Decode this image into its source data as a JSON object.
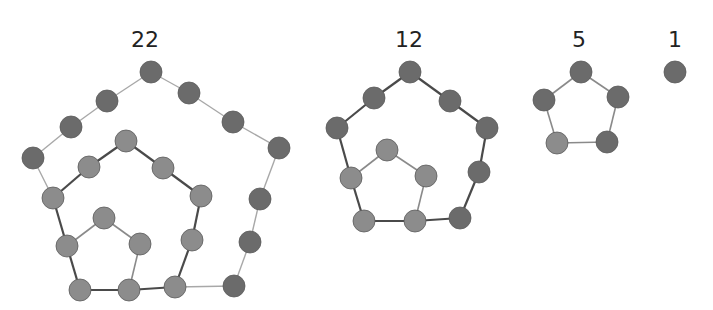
{
  "colors": {
    "node_dark": "#6b6b6b",
    "node_light": "#8c8c8c",
    "node_stroke": "#5a5a5a",
    "edge_thin": "#a8a8a8",
    "edge_thick": "#4a4a4a",
    "edge_mid": "#8a8a8a",
    "label": "#222222"
  },
  "node_radius": 11,
  "graphs": [
    {
      "label": "22",
      "label_pos": [
        145,
        47
      ],
      "nodes": [
        {
          "id": 0,
          "x": 151,
          "y": 72,
          "tone": "dark"
        },
        {
          "id": 1,
          "x": 107,
          "y": 101,
          "tone": "dark"
        },
        {
          "id": 2,
          "x": 71,
          "y": 127,
          "tone": "dark"
        },
        {
          "id": 3,
          "x": 33,
          "y": 158,
          "tone": "dark"
        },
        {
          "id": 4,
          "x": 189,
          "y": 93,
          "tone": "dark"
        },
        {
          "id": 5,
          "x": 233,
          "y": 122,
          "tone": "dark"
        },
        {
          "id": 6,
          "x": 279,
          "y": 148,
          "tone": "dark"
        },
        {
          "id": 7,
          "x": 260,
          "y": 199,
          "tone": "dark"
        },
        {
          "id": 8,
          "x": 250,
          "y": 242,
          "tone": "dark"
        },
        {
          "id": 9,
          "x": 234,
          "y": 286,
          "tone": "dark"
        },
        {
          "id": 10,
          "x": 53,
          "y": 198,
          "tone": "light"
        },
        {
          "id": 11,
          "x": 89,
          "y": 167,
          "tone": "light"
        },
        {
          "id": 12,
          "x": 126,
          "y": 141,
          "tone": "light"
        },
        {
          "id": 13,
          "x": 163,
          "y": 168,
          "tone": "light"
        },
        {
          "id": 14,
          "x": 201,
          "y": 196,
          "tone": "light"
        },
        {
          "id": 15,
          "x": 192,
          "y": 240,
          "tone": "light"
        },
        {
          "id": 16,
          "x": 175,
          "y": 287,
          "tone": "light"
        },
        {
          "id": 17,
          "x": 129,
          "y": 290,
          "tone": "light"
        },
        {
          "id": 18,
          "x": 80,
          "y": 290,
          "tone": "light"
        },
        {
          "id": 19,
          "x": 67,
          "y": 246,
          "tone": "light"
        },
        {
          "id": 20,
          "x": 104,
          "y": 218,
          "tone": "light"
        },
        {
          "id": 21,
          "x": 140,
          "y": 244,
          "tone": "light"
        }
      ],
      "edges": [
        [
          0,
          1,
          "thin"
        ],
        [
          1,
          2,
          "thin"
        ],
        [
          2,
          3,
          "thin"
        ],
        [
          3,
          10,
          "thin"
        ],
        [
          0,
          4,
          "thin"
        ],
        [
          4,
          5,
          "thin"
        ],
        [
          5,
          6,
          "thin"
        ],
        [
          6,
          7,
          "thin"
        ],
        [
          7,
          8,
          "thin"
        ],
        [
          8,
          9,
          "thin"
        ],
        [
          9,
          16,
          "thin"
        ],
        [
          10,
          11,
          "thick"
        ],
        [
          11,
          12,
          "thick"
        ],
        [
          12,
          13,
          "thick"
        ],
        [
          13,
          14,
          "thick"
        ],
        [
          14,
          15,
          "thick"
        ],
        [
          15,
          16,
          "thick"
        ],
        [
          16,
          17,
          "thick"
        ],
        [
          17,
          18,
          "thick"
        ],
        [
          18,
          19,
          "thick"
        ],
        [
          19,
          10,
          "thick"
        ],
        [
          19,
          20,
          "mid"
        ],
        [
          20,
          21,
          "mid"
        ],
        [
          21,
          17,
          "mid"
        ]
      ]
    },
    {
      "label": "12",
      "label_pos": [
        409,
        47
      ],
      "nodes": [
        {
          "id": 0,
          "x": 410,
          "y": 72,
          "tone": "dark"
        },
        {
          "id": 1,
          "x": 374,
          "y": 98,
          "tone": "dark"
        },
        {
          "id": 2,
          "x": 337,
          "y": 128,
          "tone": "dark"
        },
        {
          "id": 3,
          "x": 450,
          "y": 101,
          "tone": "dark"
        },
        {
          "id": 4,
          "x": 487,
          "y": 128,
          "tone": "dark"
        },
        {
          "id": 5,
          "x": 479,
          "y": 172,
          "tone": "dark"
        },
        {
          "id": 6,
          "x": 460,
          "y": 218,
          "tone": "dark"
        },
        {
          "id": 7,
          "x": 415,
          "y": 221,
          "tone": "light"
        },
        {
          "id": 8,
          "x": 364,
          "y": 221,
          "tone": "light"
        },
        {
          "id": 9,
          "x": 351,
          "y": 178,
          "tone": "light"
        },
        {
          "id": 10,
          "x": 387,
          "y": 150,
          "tone": "light"
        },
        {
          "id": 11,
          "x": 426,
          "y": 176,
          "tone": "light"
        }
      ],
      "edges": [
        [
          0,
          1,
          "thick"
        ],
        [
          1,
          2,
          "thick"
        ],
        [
          0,
          3,
          "thick"
        ],
        [
          3,
          4,
          "thick"
        ],
        [
          4,
          5,
          "thick"
        ],
        [
          5,
          6,
          "thick"
        ],
        [
          6,
          7,
          "thick"
        ],
        [
          7,
          8,
          "thick"
        ],
        [
          8,
          9,
          "thick"
        ],
        [
          9,
          2,
          "thick"
        ],
        [
          9,
          10,
          "mid"
        ],
        [
          10,
          11,
          "mid"
        ],
        [
          11,
          7,
          "mid"
        ]
      ]
    },
    {
      "label": "5",
      "label_pos": [
        579,
        47
      ],
      "nodes": [
        {
          "id": 0,
          "x": 581,
          "y": 72,
          "tone": "dark"
        },
        {
          "id": 1,
          "x": 544,
          "y": 100,
          "tone": "dark"
        },
        {
          "id": 2,
          "x": 618,
          "y": 97,
          "tone": "dark"
        },
        {
          "id": 3,
          "x": 557,
          "y": 143,
          "tone": "light"
        },
        {
          "id": 4,
          "x": 607,
          "y": 142,
          "tone": "dark"
        }
      ],
      "edges": [
        [
          0,
          1,
          "mid"
        ],
        [
          0,
          2,
          "mid"
        ],
        [
          1,
          3,
          "mid"
        ],
        [
          2,
          4,
          "mid"
        ],
        [
          3,
          4,
          "mid"
        ]
      ]
    },
    {
      "label": "1",
      "label_pos": [
        675,
        47
      ],
      "nodes": [
        {
          "id": 0,
          "x": 675,
          "y": 72,
          "tone": "dark"
        }
      ],
      "edges": []
    }
  ]
}
